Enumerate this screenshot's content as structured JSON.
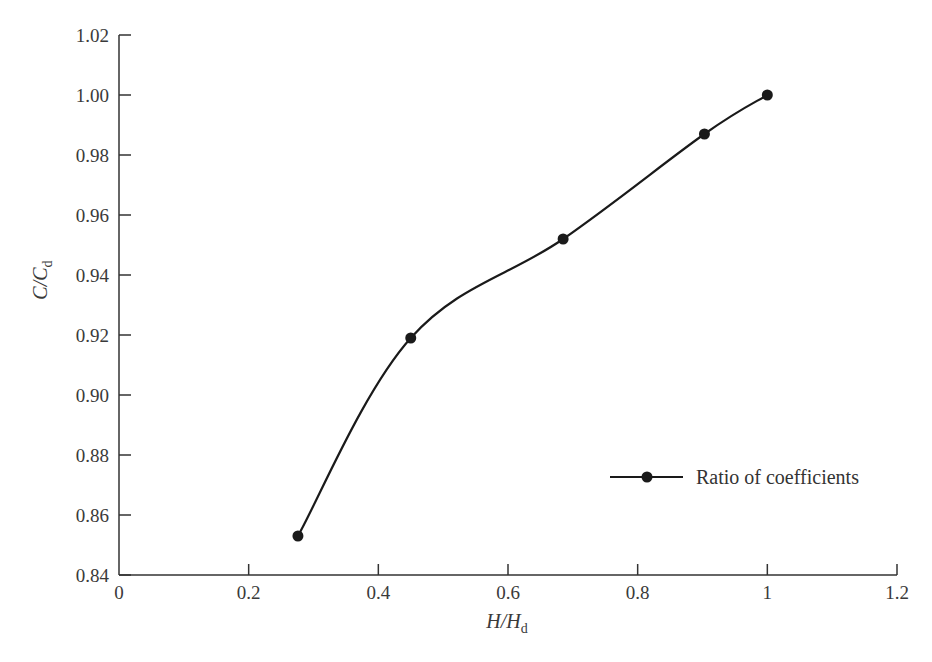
{
  "chart_data": {
    "type": "line",
    "title": "",
    "xlabel": "H/H_d",
    "ylabel": "C/C_d",
    "xlabel_parts": {
      "main": "H/H",
      "sub": "d"
    },
    "ylabel_parts": {
      "main": "C/C",
      "sub": "d"
    },
    "xlim": [
      0,
      1.2
    ],
    "ylim": [
      0.84,
      1.02
    ],
    "x_ticks": [
      "0",
      "0.2",
      "0.4",
      "0.6",
      "0.8",
      "1",
      "1.2"
    ],
    "x_tick_values": [
      0,
      0.2,
      0.4,
      0.6,
      0.8,
      1.0,
      1.2
    ],
    "y_ticks": [
      "0.84",
      "0.86",
      "0.88",
      "0.90",
      "0.92",
      "0.94",
      "0.96",
      "0.98",
      "1.00",
      "1.02"
    ],
    "y_tick_values": [
      0.84,
      0.86,
      0.88,
      0.9,
      0.92,
      0.94,
      0.96,
      0.98,
      1.0,
      1.02
    ],
    "grid": false,
    "legend_position": "lower right",
    "series": [
      {
        "name": "Ratio of coefficients",
        "marker": "filled-circle",
        "smooth": true,
        "color": "#1a1a1a",
        "x": [
          0.276,
          0.45,
          0.685,
          0.903,
          1.0
        ],
        "values": [
          0.853,
          0.919,
          0.952,
          0.987,
          1.0
        ]
      }
    ]
  }
}
